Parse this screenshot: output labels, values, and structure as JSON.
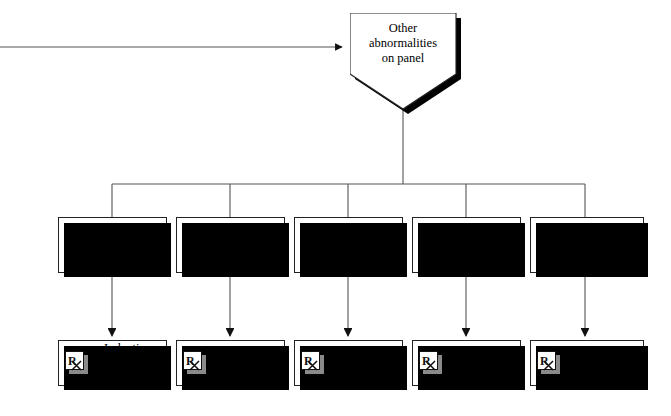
{
  "diagram": {
    "type": "flowchart",
    "title": "Other abnormalities on panel",
    "root": {
      "id": "other-abnormalities",
      "shape": "pentagon",
      "label": "Other\nabnormalities\non panel"
    },
    "incoming_edge": {
      "label": "",
      "direction": "right",
      "arrowhead": "filled-triangle"
    },
    "branches": [
      {
        "id": "branch-renal",
        "finding": "↑ Cholesterol,\n↑ Urine GGT/Cr,\n↑ Fe Na",
        "diagnosis": "Induction\nstage acute\nrenal failure",
        "icon": "rx-icon"
      },
      {
        "id": "branch-liver",
        "finding": "↑ AST,\n↑ alk phos,\n↑ bile acids",
        "diagnosis": "Liver\ndisease",
        "icon": "rx-icon"
      },
      {
        "id": "branch-adrenal",
        "finding": "Stress pattern,\n↓ lymphs,\n↓ EOS",
        "diagnosis": "Hyperadreno-\ncorticism",
        "icon": "rx-icon"
      },
      {
        "id": "branch-thyroid",
        "finding": "↑ T₄",
        "diagnosis": "Hyper-\nthyroidism",
        "icon": "rx-icon"
      },
      {
        "id": "branch-diabetes",
        "finding": "↑ Blood glucose",
        "diagnosis": "Diabetes\nmellitus",
        "icon": "rx-icon"
      }
    ],
    "colors": {
      "background": "#ffffff",
      "stroke": "#222222",
      "shadow": "#000000",
      "icon_shadow": "#8a8a8a",
      "wire": "#555555"
    }
  }
}
